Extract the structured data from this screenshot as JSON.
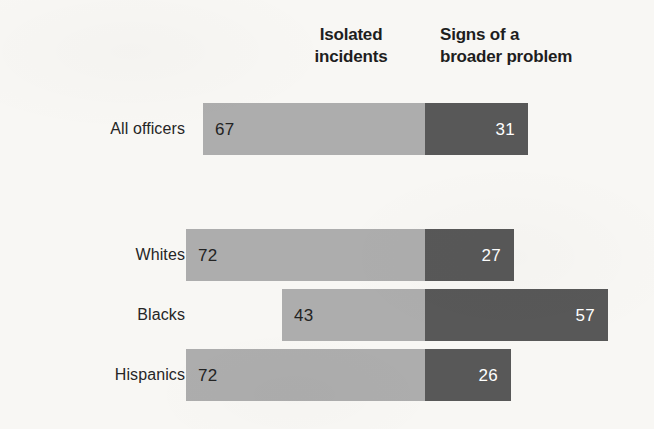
{
  "chart_data": {
    "type": "bar",
    "subtype": "horizontal-stacked-diverging",
    "title": "",
    "xlabel": "",
    "ylabel": "",
    "grid": false,
    "legend_position": "top",
    "categories": [
      "All officers",
      "Whites",
      "Blacks",
      "Hispanics"
    ],
    "series": [
      {
        "name": "Isolated incidents",
        "values": [
          67,
          72,
          43,
          72
        ],
        "color": "#adadad"
      },
      {
        "name": "Signs of a broader problem",
        "values": [
          31,
          27,
          57,
          26
        ],
        "color": "#585858"
      }
    ],
    "units": "percent",
    "xlim": [
      0,
      100
    ],
    "annotations": []
  },
  "headers": {
    "left": {
      "line1": "Isolated",
      "line2": "incidents"
    },
    "right": {
      "line1": "Signs of a",
      "line2": "broader problem"
    }
  },
  "rows": [
    {
      "label": "All officers",
      "left_value": "67",
      "right_value": "31",
      "left_width": 222,
      "right_width": 103
    },
    {
      "label": "Whites",
      "left_value": "72",
      "right_value": "27",
      "left_width": 239,
      "right_width": 89
    },
    {
      "label": "Blacks",
      "left_value": "43",
      "right_value": "57",
      "left_width": 143,
      "right_width": 183
    },
    {
      "label": "Hispanics",
      "left_value": "72",
      "right_value": "26",
      "left_width": 239,
      "right_width": 86
    }
  ],
  "colors": {
    "light_bar": "#adadad",
    "dark_bar": "#585858",
    "background": "#f8f7f4",
    "label_text": "#262626",
    "header_text": "#1e1e1e"
  }
}
